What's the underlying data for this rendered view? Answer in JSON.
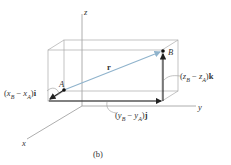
{
  "diagram": {
    "axes": {
      "x_label": "x",
      "y_label": "y",
      "z_label": "z"
    },
    "points": {
      "A": "A",
      "B": "B"
    },
    "vector_label": "r",
    "components": {
      "x": {
        "open": "(",
        "var1": "x",
        "sub1": "B",
        "minus": " − ",
        "var2": "x",
        "sub2": "A",
        "close": ")",
        "unit": "i"
      },
      "y": {
        "open": "(",
        "var1": "y",
        "sub1": "B",
        "minus": " − ",
        "var2": "y",
        "sub2": "A",
        "close": ")",
        "unit": "j"
      },
      "z": {
        "open": "(",
        "var1": "z",
        "sub1": "B",
        "minus": " − ",
        "var2": "z",
        "sub2": "A",
        "close": ")",
        "unit": "k"
      }
    },
    "caption": "(b)",
    "colors": {
      "vector_r": "#8fb3cc",
      "lines": "#888888",
      "components": "#222222"
    }
  }
}
